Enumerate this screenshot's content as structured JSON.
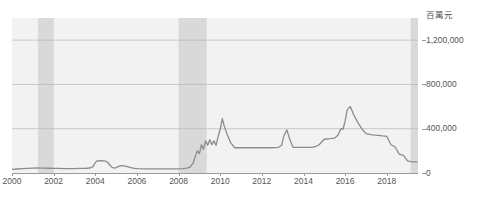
{
  "chart_data": {
    "type": "line",
    "title": "",
    "subtitle": "",
    "xlabel": "",
    "ylabel": "",
    "unit_label": "百萬元",
    "xlim": [
      2000.0,
      2019.5
    ],
    "ylim": [
      0,
      1400000
    ],
    "grid": true,
    "gridlines_y": [
      400000,
      800000,
      1200000
    ],
    "legend": "none",
    "y_ticks": [
      {
        "value": 0,
        "label": "0"
      },
      {
        "value": 400000,
        "label": "400,000"
      },
      {
        "value": 800000,
        "label": "800,000"
      },
      {
        "value": 1200000,
        "label": "1,200,000"
      }
    ],
    "x_ticks": [
      {
        "value": 2000,
        "label": "2000"
      },
      {
        "value": 2002,
        "label": "2002"
      },
      {
        "value": 2004,
        "label": "2004"
      },
      {
        "value": 2006,
        "label": "2006"
      },
      {
        "value": 2008,
        "label": "2008"
      },
      {
        "value": 2010,
        "label": "2010"
      },
      {
        "value": 2012,
        "label": "2012"
      },
      {
        "value": 2014,
        "label": "2014"
      },
      {
        "value": 2016,
        "label": "2016"
      },
      {
        "value": 2018,
        "label": "2018"
      }
    ],
    "shaded_bands": [
      {
        "name": "recession-band-1",
        "x0": 2001.25,
        "x1": 2002.0
      },
      {
        "name": "recession-band-2",
        "x0": 2008.0,
        "x1": 2009.35
      },
      {
        "name": "recession-band-3",
        "x0": 2019.15,
        "x1": 2019.5
      }
    ],
    "series": [
      {
        "name": "value",
        "color": "#8c8c8c",
        "x": [
          2000.0,
          2000.25,
          2000.5,
          2000.75,
          2001.0,
          2001.25,
          2001.5,
          2001.75,
          2002.0,
          2002.25,
          2002.5,
          2002.75,
          2003.0,
          2003.25,
          2003.5,
          2003.75,
          2003.9,
          2004.0,
          2004.1,
          2004.25,
          2004.4,
          2004.5,
          2004.6,
          2004.7,
          2004.8,
          2004.9,
          2005.0,
          2005.15,
          2005.3,
          2005.5,
          2005.7,
          2005.9,
          2006.0,
          2006.5,
          2007.0,
          2007.5,
          2008.0,
          2008.2,
          2008.4,
          2008.55,
          2008.7,
          2008.8,
          2008.9,
          2009.0,
          2009.1,
          2009.2,
          2009.3,
          2009.4,
          2009.5,
          2009.6,
          2009.7,
          2009.8,
          2009.9,
          2010.0,
          2010.1,
          2010.2,
          2010.35,
          2010.5,
          2010.7,
          2011.0,
          2011.5,
          2012.0,
          2012.5,
          2012.8,
          2012.95,
          2013.05,
          2013.2,
          2013.35,
          2013.5,
          2014.0,
          2014.4,
          2014.6,
          2014.75,
          2015.0,
          2015.3,
          2015.5,
          2015.65,
          2015.8,
          2015.9,
          2016.0,
          2016.1,
          2016.25,
          2016.4,
          2016.6,
          2016.8,
          2017.0,
          2017.3,
          2017.6,
          2017.8,
          2018.0,
          2018.2,
          2018.4,
          2018.6,
          2018.8,
          2019.0,
          2019.2,
          2019.45
        ],
        "y": [
          32000,
          36000,
          40000,
          42000,
          44000,
          45000,
          44000,
          43000,
          42000,
          41000,
          40000,
          40000,
          40000,
          41000,
          42000,
          45000,
          60000,
          95000,
          110000,
          112000,
          110000,
          108000,
          95000,
          72000,
          52000,
          45000,
          48000,
          62000,
          66000,
          60000,
          48000,
          42000,
          40000,
          38000,
          38000,
          38000,
          38000,
          40000,
          44000,
          52000,
          90000,
          150000,
          200000,
          175000,
          255000,
          215000,
          290000,
          250000,
          300000,
          255000,
          290000,
          250000,
          330000,
          395000,
          490000,
          420000,
          340000,
          275000,
          228000,
          228000,
          228000,
          228000,
          228000,
          232000,
          250000,
          330000,
          390000,
          300000,
          232000,
          232000,
          232000,
          240000,
          255000,
          305000,
          310000,
          315000,
          340000,
          400000,
          395000,
          470000,
          570000,
          600000,
          530000,
          460000,
          400000,
          355000,
          345000,
          340000,
          335000,
          332000,
          255000,
          235000,
          170000,
          160000,
          110000,
          100000,
          100000
        ]
      }
    ]
  }
}
